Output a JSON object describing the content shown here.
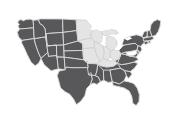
{
  "figure": {
    "kind": "choropleth-map",
    "width": 173,
    "height": 119,
    "background_color": "#ffffff",
    "has_title": false,
    "has_legend": false,
    "has_labels": false,
    "has_axes": false
  },
  "style": {
    "default_fill": "#58585a",
    "highlight_fill": "#e4e4e4",
    "border_color": "#d9d9d9",
    "highlight_border_color": "#cfcfcf",
    "water_color": "#ffffff",
    "border_width": 0.9
  },
  "map_data": {
    "type": "choropleth",
    "projection": "albers-usa",
    "regions_shown": "contiguous-48-states",
    "categories": [
      {
        "key": "highlighted",
        "fill": "#e4e4e4",
        "label": "Highlighted region",
        "states": [
          "Minnesota",
          "Iowa",
          "Wisconsin",
          "Illinois",
          "Michigan",
          "Indiana",
          "Ohio",
          "Missouri",
          "Kentucky"
        ]
      },
      {
        "key": "default",
        "fill": "#58585a",
        "label": "Other states",
        "states": [
          "Washington",
          "Oregon",
          "California",
          "Nevada",
          "Idaho",
          "Montana",
          "Wyoming",
          "Utah",
          "Arizona",
          "Colorado",
          "New Mexico",
          "North Dakota",
          "South Dakota",
          "Nebraska",
          "Kansas",
          "Oklahoma",
          "Texas",
          "Arkansas",
          "Louisiana",
          "Mississippi",
          "Alabama",
          "Tennessee",
          "Georgia",
          "Florida",
          "South Carolina",
          "North Carolina",
          "Virginia",
          "West Virginia",
          "Maryland",
          "Delaware",
          "Pennsylvania",
          "New Jersey",
          "New York",
          "Connecticut",
          "Rhode Island",
          "Massachusetts",
          "Vermont",
          "New Hampshire",
          "Maine"
        ]
      }
    ],
    "water_features": [
      "Lake Superior",
      "Lake Michigan",
      "Lake Huron",
      "Lake Erie",
      "Lake Ontario"
    ]
  }
}
